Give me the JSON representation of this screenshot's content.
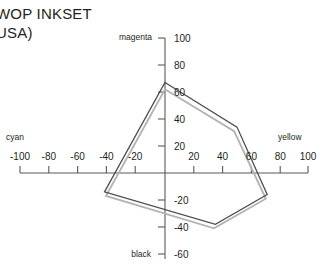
{
  "title": {
    "line1": "WOP INKSET",
    "line2": "USA)"
  },
  "axis_labels": {
    "left": "cyan",
    "right": "yellow",
    "top": "magenta",
    "bottom": "black"
  },
  "ticks": {
    "x_left": [
      "-100",
      "-80",
      "-60",
      "-40",
      "-20"
    ],
    "x_right": [
      "20",
      "40",
      "60",
      "80",
      "100"
    ],
    "y_up": [
      "20",
      "40",
      "60",
      "80",
      "100"
    ],
    "y_down": [
      "-20",
      "-40",
      "-60"
    ]
  },
  "colors": {
    "series_dark": "#4d4d4d",
    "series_light": "#b3b3b3",
    "axis": "#58595b",
    "text": "#231f20"
  },
  "chart_data": {
    "type": "line",
    "xlabel": "cyan / yellow",
    "ylabel": "black / magenta",
    "xlim": [
      -100,
      100
    ],
    "ylim": [
      -60,
      100
    ],
    "grid": false,
    "legend": "none",
    "axis_directions": {
      "negative_x": "cyan",
      "positive_x": "yellow",
      "positive_y": "magenta",
      "negative_y": "black"
    },
    "series": [
      {
        "name": "inkset-gamut-outer",
        "closed": true,
        "color": "#4d4d4d",
        "points": [
          [
            0,
            67
          ],
          [
            50,
            34
          ],
          [
            71,
            -16
          ],
          [
            35,
            -38
          ],
          [
            -42,
            -14
          ]
        ]
      },
      {
        "name": "inkset-gamut-inner",
        "closed": true,
        "color": "#b3b3b3",
        "points": [
          [
            0,
            62
          ],
          [
            48,
            31
          ],
          [
            70,
            -19
          ],
          [
            34,
            -41
          ],
          [
            -41,
            -17
          ]
        ]
      }
    ]
  }
}
